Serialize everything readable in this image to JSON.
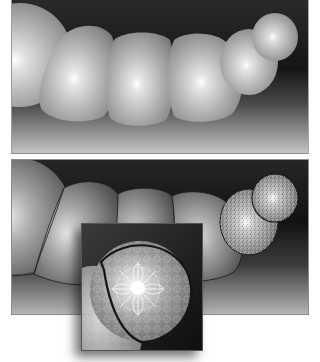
{
  "image": {
    "description": "Illustration of a caterpillar-like chain of shaded spheres, shown twice: smooth-shaded on top, and with outlined segments and patterned textures below, plus a magnified inset of the head segment.",
    "panels": [
      {
        "name": "top-panel",
        "style": "smooth gradient shading",
        "segments": 6
      },
      {
        "name": "bottom-panel",
        "style": "outlined segments with textured head",
        "segments": 6
      },
      {
        "name": "inset",
        "style": "magnified head segment with ornamental pattern"
      }
    ],
    "colors": {
      "background": "#ffffff",
      "panel_dark": "#1a1a1a",
      "panel_floor": "#b8b8b8",
      "sphere_highlight": "#ffffff",
      "sphere_mid": "#a8a8a8",
      "sphere_shadow": "#5a5a5a",
      "outline": "#1c1c1c"
    }
  }
}
